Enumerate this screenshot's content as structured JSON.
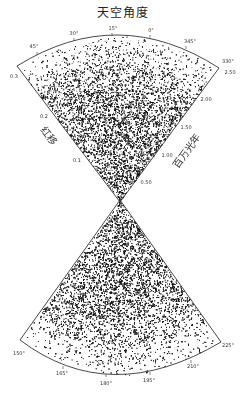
{
  "title": "天空角度",
  "axes": {
    "redshift_label": "红移",
    "distance_label": "百万光年"
  },
  "top_wedge": {
    "angle_ticks": [
      {
        "label": "45°",
        "x": 34,
        "y": 46
      },
      {
        "label": "30°",
        "x": 74,
        "y": 33
      },
      {
        "label": "15°",
        "x": 113,
        "y": 28
      },
      {
        "label": "0°",
        "x": 151,
        "y": 30
      },
      {
        "label": "345°",
        "x": 190,
        "y": 41
      },
      {
        "label": "330°",
        "x": 228,
        "y": 61
      }
    ],
    "redshift_ticks": [
      {
        "label": "0.3",
        "x": 14,
        "y": 76
      },
      {
        "label": "0.2",
        "x": 44,
        "y": 116
      },
      {
        "label": "0.1",
        "x": 77,
        "y": 160
      }
    ],
    "distance_ticks": [
      {
        "label": "2.50",
        "x": 230,
        "y": 72
      },
      {
        "label": "2.00",
        "x": 206,
        "y": 99
      },
      {
        "label": "1.50",
        "x": 186,
        "y": 127
      },
      {
        "label": "1.00",
        "x": 167,
        "y": 155
      },
      {
        "label": "0.50",
        "x": 146,
        "y": 182
      }
    ]
  },
  "bottom_wedge": {
    "angle_ticks": [
      {
        "label": "150°",
        "x": 19,
        "y": 353
      },
      {
        "label": "165°",
        "x": 62,
        "y": 373
      },
      {
        "label": "180°",
        "x": 106,
        "y": 383
      },
      {
        "label": "195°",
        "x": 149,
        "y": 380
      },
      {
        "label": "210°",
        "x": 193,
        "y": 366
      },
      {
        "label": "225°",
        "x": 228,
        "y": 345
      }
    ]
  },
  "colors": {
    "ink": "#111111",
    "background": "#ffffff"
  }
}
